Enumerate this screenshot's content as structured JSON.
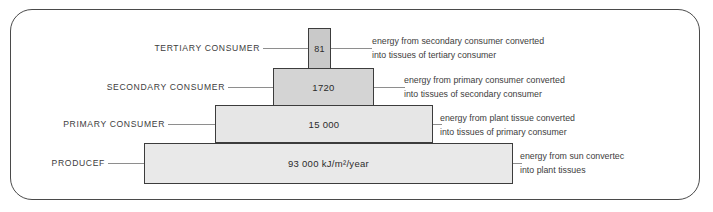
{
  "chart_data": {
    "type": "bar",
    "xlabel": "",
    "ylabel": "Trophic level",
    "units": "kJ/m²/year",
    "categories": [
      "TERTIARY CONSUMER",
      "SECONDARY CONSUMER",
      "PRIMARY CONSUMER",
      "PRODUCER"
    ],
    "values": [
      81,
      1720,
      15000,
      93000
    ],
    "value_labels": [
      "81",
      "1720",
      "15 000",
      "93 000 kJ/m²/year"
    ],
    "annotations": [
      "energy from secondary consumer converted into tissues of tertiary consumer",
      "energy from primary consumer converted into tissues of secondary consumer",
      "energy from plant tissue converted into tissues of primary consumer",
      "energy from sun converted into plant tissues"
    ],
    "grid": false,
    "legend": "none"
  },
  "levels": [
    {
      "id": "tertiary",
      "label": "TERTIARY CONSUMER",
      "value": "81",
      "note_line1": "energy from secondary consumer converted",
      "note_line2": "into tissues of tertiary consumer",
      "color": "#c9c9c9"
    },
    {
      "id": "secondary",
      "label": "SECONDARY CONSUMER",
      "value": "1720",
      "note_line1": "energy from primary consumer converted",
      "note_line2": "into tissues of secondary consumer",
      "color": "#d4d4d4"
    },
    {
      "id": "primary",
      "label": "PRIMARY CONSUMER",
      "value": "15 000",
      "note_line1": "energy from plant tissue converted",
      "note_line2": "into tissues of primary consumer",
      "color": "#e6e6e6"
    },
    {
      "id": "producer",
      "label": "PRODUCEF",
      "value": "93 000 kJ/m²/year",
      "note_line1": "energy from sun convertec",
      "note_line2": "into plant tissues",
      "color": "#e9e9e9"
    }
  ],
  "colors": {
    "frame_border": "#4a4a4a",
    "bar_border": "#3c3c3c",
    "leader_line": "#8e8e8e",
    "text": "#3d3d3d",
    "background": "#ffffff"
  }
}
